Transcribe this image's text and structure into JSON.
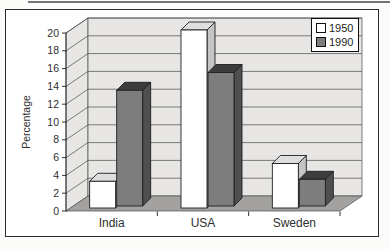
{
  "chart_data": {
    "type": "bar",
    "style": "3d-clustered-column",
    "title": "",
    "xlabel": "",
    "ylabel": "Percentage",
    "categories": [
      "India",
      "USA",
      "Sweden"
    ],
    "series": [
      {
        "name": "1950",
        "values": [
          3,
          20,
          5
        ],
        "color": "#ffffff",
        "top_color": "#dedede",
        "side_color": "#c4c4c4"
      },
      {
        "name": "1990",
        "values": [
          13,
          15,
          3
        ],
        "color": "#7d7d7d",
        "top_color": "#3d3d3d",
        "side_color": "#4f4f4f"
      }
    ],
    "ylim": [
      0,
      20
    ],
    "ytick_step": 2,
    "yticks": [
      "0",
      "2",
      "4",
      "6",
      "8",
      "10",
      "12",
      "14",
      "16",
      "18",
      "20"
    ],
    "grid": true,
    "legend_position": "top-right"
  },
  "legend": {
    "items": [
      {
        "label": "1950",
        "swatch": "#ffffff"
      },
      {
        "label": "1990",
        "swatch": "#7d7d7d"
      }
    ]
  },
  "colors": {
    "wall": "#e7e6e4",
    "floor": "#a3a2a0",
    "gridline": "#4a4a4a",
    "axis": "#333333",
    "bar_outline": "#1f1f1f",
    "frame_border": "#2a2a2a",
    "text": "#2e2e2e"
  }
}
